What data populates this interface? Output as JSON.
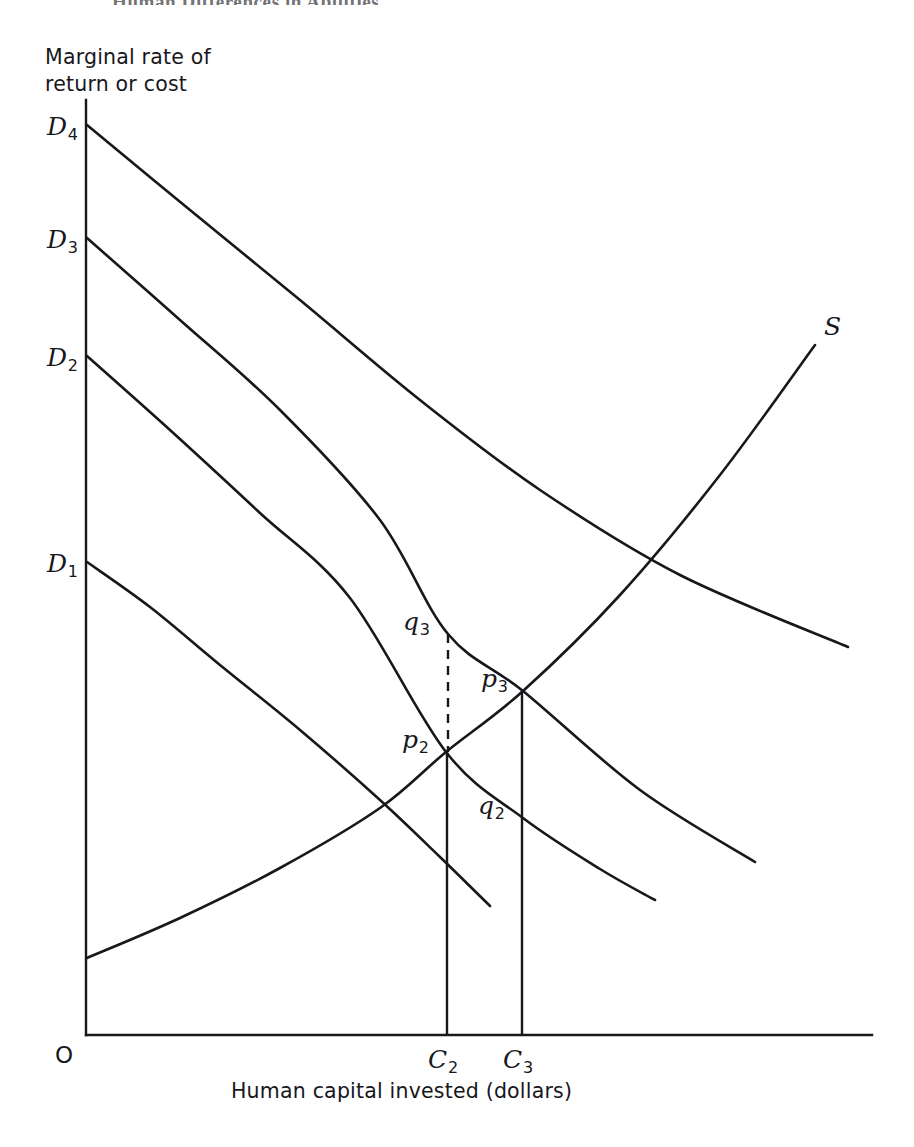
{
  "page": {
    "header": "Human Differences in Abilities",
    "width": 914,
    "height": 1147,
    "background": "#ffffff",
    "ink_color": "#17171c"
  },
  "figure": {
    "y_axis_title_line1": "Marginal rate of",
    "y_axis_title_line2": "return or cost",
    "x_axis_title": "Human capital invested (dollars)",
    "origin_label": "O"
  },
  "chart_data": {
    "type": "line",
    "title": "",
    "xlabel": "Human capital invested (dollars)",
    "ylabel": "Marginal rate of return or cost",
    "grid": false,
    "legend": "inline-curve-labels",
    "axes": {
      "x_axis_y_px": 1035,
      "y_axis_x_px": 86,
      "y_axis_top_px": 100,
      "x_axis_right_px": 872
    },
    "series": [
      {
        "name": "D1",
        "label": "D",
        "subscript": "1",
        "kind": "demand",
        "style": "solid",
        "label_pos": {
          "x": 47,
          "y": 547
        },
        "points": [
          [
            87,
            562
          ],
          [
            150,
            607
          ],
          [
            220,
            665
          ],
          [
            300,
            730
          ],
          [
            380,
            800
          ],
          [
            440,
            857
          ],
          [
            490,
            906
          ]
        ]
      },
      {
        "name": "D2",
        "label": "D",
        "subscript": "2",
        "kind": "demand",
        "style": "solid",
        "label_pos": {
          "x": 47,
          "y": 341
        },
        "points": [
          [
            87,
            356
          ],
          [
            170,
            430
          ],
          [
            260,
            513
          ],
          [
            350,
            598
          ],
          [
            446,
            752
          ],
          [
            523,
            818
          ],
          [
            600,
            869
          ],
          [
            655,
            900
          ]
        ]
      },
      {
        "name": "D3",
        "label": "D",
        "subscript": "3",
        "kind": "demand",
        "style": "solid",
        "label_pos": {
          "x": 47,
          "y": 223
        },
        "points": [
          [
            87,
            238
          ],
          [
            180,
            320
          ],
          [
            280,
            410
          ],
          [
            380,
            520
          ],
          [
            448,
            634
          ],
          [
            523,
            691
          ],
          [
            640,
            790
          ],
          [
            755,
            862
          ]
        ]
      },
      {
        "name": "D4",
        "label": "D",
        "subscript": "4",
        "kind": "demand",
        "style": "solid",
        "label_pos": {
          "x": 47,
          "y": 110
        },
        "points": [
          [
            87,
            125
          ],
          [
            190,
            210
          ],
          [
            300,
            300
          ],
          [
            420,
            400
          ],
          [
            540,
            490
          ],
          [
            680,
            575
          ],
          [
            848,
            647
          ]
        ]
      },
      {
        "name": "S",
        "label": "S",
        "subscript": "",
        "kind": "supply",
        "style": "solid",
        "label_pos": {
          "x": 824,
          "y": 310
        },
        "points": [
          [
            87,
            958
          ],
          [
            180,
            918
          ],
          [
            280,
            868
          ],
          [
            380,
            808
          ],
          [
            446,
            752
          ],
          [
            523,
            691
          ],
          [
            620,
            595
          ],
          [
            720,
            475
          ],
          [
            815,
            345
          ]
        ]
      }
    ],
    "points": [
      {
        "name": "p2",
        "label": "p",
        "subscript": "2",
        "x_px": 446,
        "y_px": 752,
        "label_pos": {
          "x": 402,
          "y": 723
        },
        "description": "intersection of D2 and S"
      },
      {
        "name": "p3",
        "label": "p",
        "subscript": "3",
        "x_px": 523,
        "y_px": 691,
        "label_pos": {
          "x": 481,
          "y": 662
        },
        "description": "intersection of D3 and S"
      },
      {
        "name": "q2",
        "label": "q",
        "subscript": "2",
        "x_px": 523,
        "y_px": 818,
        "label_pos": {
          "x": 478,
          "y": 789
        },
        "description": "point on D2 at C3"
      },
      {
        "name": "q3",
        "label": "q",
        "subscript": "3",
        "x_px": 448,
        "y_px": 634,
        "label_pos": {
          "x": 403,
          "y": 605
        },
        "description": "point on D3 at C2"
      }
    ],
    "drop_lines": [
      {
        "name": "C2-vertical",
        "x_px": 447,
        "from_y_px": 752,
        "to_y_px": 1035,
        "style": "solid"
      },
      {
        "name": "C3-vertical",
        "x_px": 522,
        "from_y_px": 691,
        "to_y_px": 1035,
        "style": "solid"
      },
      {
        "name": "q3-to-p2-dashed",
        "x_px": 448,
        "from_y_px": 634,
        "to_y_px": 752,
        "style": "dashed"
      }
    ],
    "x_ticks": [
      {
        "name": "C2",
        "label": "C",
        "subscript": "2",
        "x_px": 447,
        "label_pos": {
          "x": 428,
          "y": 1043
        }
      },
      {
        "name": "C3",
        "label": "C",
        "subscript": "3",
        "x_px": 522,
        "label_pos": {
          "x": 503,
          "y": 1043
        }
      }
    ]
  }
}
